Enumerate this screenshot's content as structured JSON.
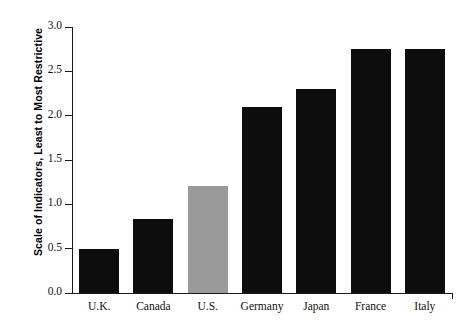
{
  "chart_data": {
    "type": "bar",
    "title": "",
    "xlabel": "",
    "ylabel": "Scale of Indicators, Least to Most Restrictive",
    "categories": [
      "U.K.",
      "Canada",
      "U.S.",
      "Germany",
      "Japan",
      "France",
      "Italy"
    ],
    "values": [
      0.5,
      0.83,
      1.21,
      2.1,
      2.3,
      2.75,
      2.75
    ],
    "bar_colors": [
      "#0d0d0d",
      "#0d0d0d",
      "#9a9a9a",
      "#0d0d0d",
      "#0d0d0d",
      "#0d0d0d",
      "#0d0d0d"
    ],
    "ylim": [
      0.0,
      3.0
    ],
    "ytick_values": [
      0.0,
      0.5,
      1.0,
      1.5,
      2.0,
      2.5,
      3.0
    ],
    "ytick_labels": [
      "0.0",
      "0.5",
      "1.0",
      "1.5",
      "2.0",
      "2.5",
      "3.0"
    ],
    "grid": false,
    "legend": false,
    "highlight_category": "U.S.",
    "highlight_color": "#9a9a9a",
    "default_bar_color": "#0d0d0d",
    "axis_color": "#1a1a1a",
    "background_color": "#ffffff"
  }
}
